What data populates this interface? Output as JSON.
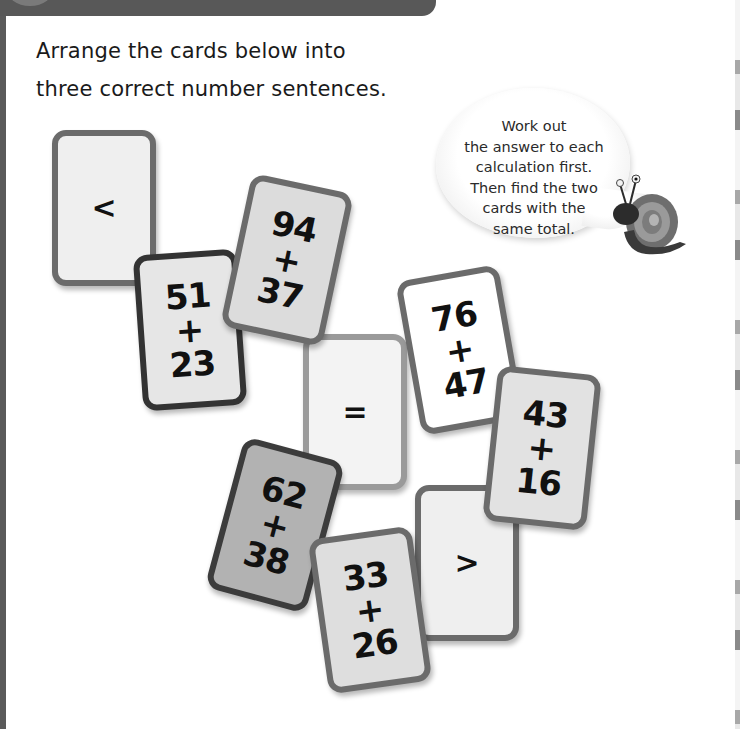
{
  "page": {
    "instructions": [
      "Arrange the cards below into",
      "three correct number sentences."
    ],
    "hint_bubble": {
      "lines": [
        "Work out",
        "the answer to each",
        "calculation first.",
        "Then find the two",
        "cards with the",
        "same total."
      ],
      "character": "snail-icon"
    }
  },
  "cards": [
    {
      "id": "lt",
      "type": "symbol",
      "symbol": "<"
    },
    {
      "id": "5123",
      "type": "addition",
      "top": "51",
      "op": "+",
      "bottom": "23"
    },
    {
      "id": "9437",
      "type": "addition",
      "top": "94",
      "op": "+",
      "bottom": "37"
    },
    {
      "id": "eq",
      "type": "symbol",
      "symbol": "="
    },
    {
      "id": "7647",
      "type": "addition",
      "top": "76",
      "op": "+",
      "bottom": "47"
    },
    {
      "id": "4316",
      "type": "addition",
      "top": "43",
      "op": "+",
      "bottom": "16"
    },
    {
      "id": "6238",
      "type": "addition",
      "top": "62",
      "op": "+",
      "bottom": "38"
    },
    {
      "id": "3326",
      "type": "addition",
      "top": "33",
      "op": "+",
      "bottom": "26"
    },
    {
      "id": "gt",
      "type": "symbol",
      "symbol": ">"
    }
  ],
  "colors": {
    "header_bar": "#585858",
    "card_border": "#6b6b6b",
    "card_border_dark": "#333333",
    "card_fill_light": "#efefef",
    "card_fill_dark": "#b2b2b2"
  }
}
